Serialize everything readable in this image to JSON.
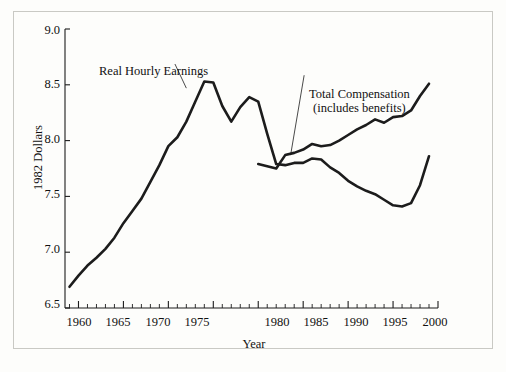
{
  "figure": {
    "background_color": "#fdfdfb",
    "frame_color": "#c9c9c4",
    "line_color": "#1c1c1c"
  },
  "chart_data": {
    "type": "line",
    "title": "",
    "xlabel": "Year",
    "ylabel": "1982 Dollars",
    "xlim": [
      1958.5,
      2000
    ],
    "ylim": [
      6.5,
      9.0
    ],
    "grid": false,
    "legend_position": "inline-annotations",
    "xticks": [
      1960,
      1965,
      1970,
      1975,
      1980,
      1985,
      1990,
      1995,
      2000
    ],
    "xticklabels": [
      "1960",
      "1965",
      "1970",
      "1975",
      "1980",
      "1985",
      "1990",
      "1995",
      "2000"
    ],
    "xminor_tick_interval": 1,
    "yticks": [
      6.5,
      7.0,
      7.5,
      8.0,
      8.5,
      9.0
    ],
    "yticklabels": [
      "6.5",
      "7.0",
      "7.5",
      "8.0",
      "8.5",
      "9.0"
    ],
    "annotations": [
      {
        "text": "Real Hourly Earnings",
        "x": 1962.5,
        "y": 8.74,
        "points_to_x": 1972.0,
        "points_to_y": 8.47
      },
      {
        "text": "Total Compensation",
        "x": 1988.0,
        "y": 8.55,
        "points_to_x": 1983.6,
        "points_to_y": 7.87
      },
      {
        "text": "(includes benefits)",
        "x": 1988.0,
        "y": 8.44,
        "points_to_x": null,
        "points_to_y": null
      }
    ],
    "series": [
      {
        "name": "Real Hourly Earnings",
        "x": [
          1959,
          1960,
          1961,
          1962,
          1963,
          1964,
          1965,
          1966,
          1967,
          1968,
          1969,
          1970,
          1971,
          1972,
          1973,
          1974,
          1975,
          1976,
          1977,
          1978,
          1979,
          1980,
          1981,
          1982,
          1983,
          1984,
          1985,
          1986,
          1987,
          1988,
          1989,
          1990,
          1991,
          1992,
          1993,
          1994,
          1995,
          1996,
          1997,
          1998,
          1999
        ],
        "values": [
          6.69,
          6.79,
          6.88,
          6.95,
          7.03,
          7.13,
          7.26,
          7.37,
          7.48,
          7.63,
          7.78,
          7.95,
          8.03,
          8.17,
          8.35,
          8.53,
          8.52,
          8.31,
          8.17,
          8.3,
          8.39,
          8.35,
          8.06,
          7.79,
          7.78,
          7.8,
          7.8,
          7.84,
          7.83,
          7.76,
          7.71,
          7.64,
          7.59,
          7.55,
          7.52,
          7.47,
          7.42,
          7.41,
          7.44,
          7.6,
          7.86
        ]
      },
      {
        "name": "Total Compensation (includes benefits)",
        "x": [
          1980,
          1981,
          1982,
          1983,
          1984,
          1985,
          1986,
          1987,
          1988,
          1989,
          1990,
          1991,
          1992,
          1993,
          1994,
          1995,
          1996,
          1997,
          1998,
          1999
        ],
        "values": [
          7.79,
          7.77,
          7.75,
          7.87,
          7.89,
          7.92,
          7.97,
          7.95,
          7.96,
          8.0,
          8.05,
          8.1,
          8.14,
          8.19,
          8.16,
          8.21,
          8.22,
          8.27,
          8.4,
          8.51
        ]
      }
    ]
  }
}
